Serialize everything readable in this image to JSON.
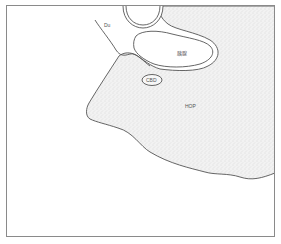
{
  "diagram": {
    "type": "anatomical-schematic",
    "labels": {
      "duodenum": "Du",
      "pancreas": "胰腺",
      "cbd": "CBD",
      "hop": "HOP"
    },
    "colors": {
      "outline": "#555555",
      "frame": "#8a8a8a",
      "stipple_fill": "#e9e9e9"
    }
  }
}
